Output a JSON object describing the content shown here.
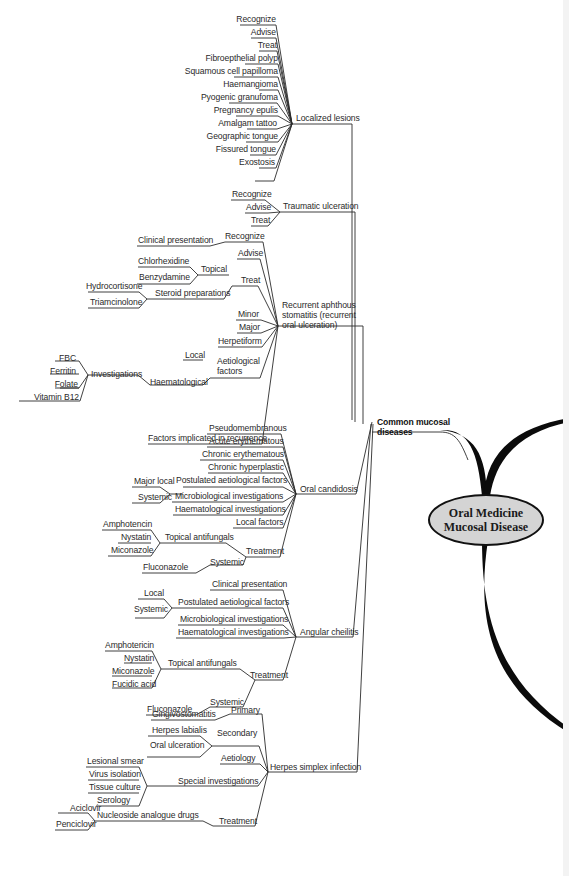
{
  "center": {
    "line1": "Oral Medicine",
    "line2": "Mucosal Disease"
  },
  "hub": {
    "line1": "Common mucosal",
    "line2": "diseases"
  },
  "branches": {
    "localized": {
      "title": "Localized lesions",
      "items": [
        "Recognize",
        "Advise",
        "Treat",
        "Fibroepthelial polyp",
        "Squamous cell papilloma",
        "Haemangioma",
        "Pyogenic granufoma",
        "Pregnancy epulis",
        "Amalgam tattoo",
        "Geographic tongue",
        "Fissured tongue",
        "Exostosis"
      ]
    },
    "traumatic": {
      "title": "Traumatic ulceration",
      "items": [
        "Recognize",
        "Advise",
        "Treat"
      ]
    },
    "ras": {
      "title_l1": "Recurrent aphthous",
      "title_l2": "stomatitis (recurrent",
      "title_l3": "oral ulceration)",
      "recognize": "Recognize",
      "clinical": "Clinical presentation",
      "advise": "Advise",
      "treat": "Treat",
      "topical": "Topical",
      "chlorhexidine": "Chlorhexidine",
      "benzydamine": "Benzydamine",
      "steroid": "Steroid preparations",
      "hydrocortisone": "Hydrocortisone",
      "triamcinolone": "Triamcinolone",
      "minor": "Minor",
      "major": "Major",
      "herpetiform": "Herpetiform",
      "aetio_l1": "Aetiological",
      "aetio_l2": "factors",
      "local": "Local",
      "haematological": "Haematological",
      "investigations": "Investigations",
      "fbc": "FBC",
      "ferritin": "Ferritin",
      "folate": "Folate",
      "b12": "Vitamin B12",
      "factors": "Factors implicated in recurrence"
    },
    "candidosis": {
      "title": "Oral candidosis",
      "pseudo": "Pseudomembranous",
      "acute": "Acute erythematous",
      "chronic_ery": "Chronic erythematous",
      "chronic_hyp": "Chronic hyperplastic",
      "postulated": "Postulated aetiological factors",
      "major_local": "Major local",
      "systemic": "Systemic",
      "micro": "Microbiological investigations",
      "haema": "Haematological investigations",
      "local_factors": "Local factors",
      "treatment": "Treatment",
      "topical_af": "Topical antifungals",
      "amphotencin": "Amphotencin",
      "nystatin": "Nystatin",
      "miconazole": "Miconazole",
      "systemic_tx": "Systemic",
      "fluconazole": "Fluconazole"
    },
    "angular": {
      "title": "Angular cheilitis",
      "clinical": "Clinical presentation",
      "postulated": "Postulated aetiological factors",
      "local": "Local",
      "systemic": "Systemic",
      "micro": "Microbiological investigations",
      "haema": "Haematological investigations",
      "treatment": "Treatment",
      "topical_af": "Topical antifungals",
      "amphotericin": "Amphotericin",
      "nystatin": "Nystatin",
      "miconazole": "Miconazole",
      "fucidic": "Fucidic acid",
      "systemic_tx": "Systemic",
      "fluconazole": "Fluconazole"
    },
    "herpes": {
      "title": "Herpes simplex infection",
      "primary": "Primary",
      "gingivo": "Gingivostomatitis",
      "secondary": "Secondary",
      "labialis": "Herpes labialis",
      "oral_ulc": "Oral ulceration",
      "aetiology": "Aetiology",
      "special": "Special investigations",
      "smear": "Lesional smear",
      "virus": "Virus isolation",
      "tissue": "Tissue culture",
      "serology": "Serology",
      "treatment": "Treatment",
      "nucleoside": "Nucleoside analogue drugs",
      "aciclovir": "Aciclovir",
      "penciclovir": "Penciclovir"
    }
  }
}
